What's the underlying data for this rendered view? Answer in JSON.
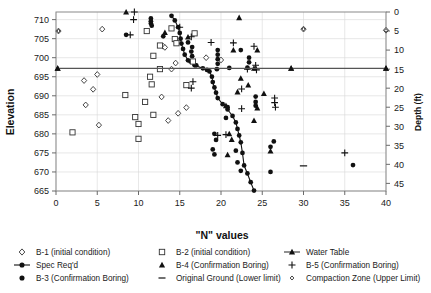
{
  "chart_data": {
    "type": "scatter",
    "title": "",
    "xlabel": "\"N\" values",
    "ylabel": "Elevation",
    "y2label": "Depth (ft)",
    "xlim": [
      0,
      40
    ],
    "ylim": [
      665,
      712
    ],
    "y2lim": [
      0,
      47
    ],
    "xticks": [
      0,
      5,
      10,
      15,
      20,
      25,
      30,
      35,
      40
    ],
    "yticks": [
      665,
      670,
      675,
      680,
      685,
      690,
      695,
      700,
      705,
      710
    ],
    "y2ticks": [
      0,
      5,
      10,
      15,
      20,
      25,
      30,
      35,
      40,
      45
    ],
    "grid": true,
    "legend_position": "bottom",
    "series": [
      {
        "name": "B-1 (initial condition)",
        "marker": "open-diamond",
        "points": [
          [
            0.3,
            707.0
          ],
          [
            5.6,
            707.5
          ],
          [
            5.0,
            695.6
          ],
          [
            3.4,
            694.0
          ],
          [
            4.5,
            691.7
          ],
          [
            3.6,
            687.6
          ],
          [
            5.2,
            682.3
          ],
          [
            13.0,
            703.0
          ],
          [
            13.2,
            702.7
          ],
          [
            14.5,
            698.6
          ],
          [
            14.0,
            697.0
          ],
          [
            12.8,
            689.7
          ],
          [
            15.8,
            686.9
          ],
          [
            14.8,
            685.4
          ],
          [
            13.6,
            683.5
          ],
          [
            18.2,
            700.0
          ],
          [
            20.0,
            699.4
          ],
          [
            30.0,
            707.5
          ],
          [
            40.0,
            707.2
          ]
        ]
      },
      {
        "name": "Spec Req'd",
        "marker": "filled-circle-line",
        "points": [
          [
            14.0,
            711.0
          ],
          [
            14.4,
            709.8
          ],
          [
            14.8,
            708.0
          ],
          [
            15.0,
            706.5
          ],
          [
            15.1,
            705.0
          ],
          [
            15.2,
            703.7
          ],
          [
            15.4,
            702.3
          ],
          [
            15.6,
            700.8
          ],
          [
            16.0,
            699.3
          ],
          [
            16.8,
            698.0
          ],
          [
            17.8,
            697.2
          ],
          [
            18.6,
            696.4
          ],
          [
            18.9,
            695.0
          ],
          [
            19.0,
            693.6
          ],
          [
            19.2,
            692.2
          ],
          [
            19.4,
            690.8
          ],
          [
            19.6,
            689.4
          ],
          [
            20.2,
            687.8
          ],
          [
            20.8,
            686.4
          ],
          [
            21.4,
            684.7
          ],
          [
            21.8,
            683.0
          ],
          [
            22.0,
            681.3
          ],
          [
            22.2,
            679.6
          ],
          [
            22.4,
            677.8
          ],
          [
            22.6,
            675.0
          ],
          [
            22.8,
            671.7
          ],
          [
            23.2,
            669.6
          ],
          [
            23.6,
            667.3
          ],
          [
            24.0,
            665.1
          ]
        ]
      },
      {
        "name": "B-3 (Confirmation Boring)",
        "marker": "filled-circle",
        "points": [
          [
            8.5,
            706.0
          ],
          [
            11.5,
            710.3
          ],
          [
            11.5,
            709.6
          ],
          [
            11.5,
            709.0
          ],
          [
            11.6,
            708.4
          ],
          [
            13.0,
            705.6
          ],
          [
            16.0,
            704.0
          ],
          [
            16.5,
            702.8
          ],
          [
            16.4,
            701.6
          ],
          [
            16.5,
            700.4
          ],
          [
            16.3,
            699.0
          ],
          [
            17.0,
            698.0
          ],
          [
            19.6,
            702.0
          ],
          [
            19.6,
            700.8
          ],
          [
            19.6,
            699.6
          ],
          [
            19.6,
            698.4
          ],
          [
            19.5,
            697.0
          ],
          [
            18.3,
            696.8
          ],
          [
            21.0,
            697.3
          ],
          [
            22.4,
            702.0
          ],
          [
            23.4,
            700.0
          ],
          [
            23.4,
            698.8
          ],
          [
            23.2,
            697.4
          ],
          [
            24.2,
            689.8
          ],
          [
            24.2,
            688.4
          ],
          [
            24.2,
            687.4
          ],
          [
            20.8,
            687.0
          ],
          [
            20.6,
            684.2
          ],
          [
            19.2,
            680.0
          ],
          [
            19.4,
            678.4
          ],
          [
            19.0,
            675.9
          ],
          [
            19.2,
            674.6
          ],
          [
            21.8,
            675.6
          ],
          [
            22.0,
            672.5
          ],
          [
            22.4,
            670.3
          ],
          [
            26.0,
            670.0
          ],
          [
            26.0,
            676.6
          ],
          [
            36.0,
            671.8
          ],
          [
            26.4,
            678.0
          ]
        ]
      },
      {
        "name": "B-2 (initial condition)",
        "marker": "open-square",
        "points": [
          [
            11.0,
            707.0
          ],
          [
            14.0,
            707.7
          ],
          [
            14.4,
            704.9
          ],
          [
            14.6,
            703.8
          ],
          [
            16.8,
            706.4
          ],
          [
            11.8,
            700.5
          ],
          [
            16.6,
            699.0
          ],
          [
            11.4,
            695.0
          ],
          [
            11.6,
            693.0
          ],
          [
            8.4,
            690.2
          ],
          [
            10.8,
            688.4
          ],
          [
            11.8,
            685.0
          ],
          [
            9.6,
            684.4
          ],
          [
            10.0,
            682.6
          ],
          [
            10.0,
            678.7
          ],
          [
            2.0,
            680.4
          ],
          [
            15.8,
            692.8
          ],
          [
            12.6,
            697.0
          ],
          [
            12.6,
            703.2
          ]
        ]
      },
      {
        "name": "B-4 (Confirmation Boring)",
        "marker": "filled-triangle",
        "points": [
          [
            8.5,
            712.0
          ],
          [
            13.2,
            706.6
          ],
          [
            16.0,
            705.4
          ],
          [
            21.5,
            702.0
          ],
          [
            24.4,
            702.0
          ],
          [
            22.2,
            710.5
          ],
          [
            24.0,
            697.2
          ],
          [
            22.4,
            694.6
          ],
          [
            23.3,
            692.8
          ],
          [
            22.0,
            691.0
          ],
          [
            25.2,
            690.6
          ],
          [
            24.4,
            686.8
          ],
          [
            20.6,
            687.4
          ],
          [
            21.0,
            680.0
          ],
          [
            21.3,
            678.5
          ],
          [
            20.8,
            674.5
          ],
          [
            26.0,
            675.5
          ],
          [
            28.5,
            697.2
          ],
          [
            40.0,
            697.2
          ],
          [
            0.2,
            697.2
          ],
          [
            24.0,
            683.5
          ]
        ]
      },
      {
        "name": "B-5 (Confirmation Boring)",
        "marker": "plus",
        "points": [
          [
            9.5,
            712.0
          ],
          [
            9.4,
            710.0
          ],
          [
            9.0,
            706.0
          ],
          [
            15.0,
            708.0
          ],
          [
            16.4,
            705.5
          ],
          [
            18.8,
            704.0
          ],
          [
            21.5,
            703.9
          ],
          [
            24.0,
            703.0
          ],
          [
            24.2,
            698.0
          ],
          [
            24.3,
            696.8
          ],
          [
            16.6,
            693.7
          ],
          [
            16.4,
            692.0
          ],
          [
            26.6,
            687.0
          ],
          [
            26.5,
            689.4
          ],
          [
            22.5,
            691.8
          ],
          [
            22.5,
            686.6
          ],
          [
            19.6,
            679.6
          ],
          [
            20.6,
            679.8
          ],
          [
            26.5,
            688.2
          ],
          [
            35.0,
            675.0
          ],
          [
            23.2,
            697.0
          ]
        ]
      },
      {
        "name": "Original Ground (Lower limit)",
        "marker": "dash",
        "points": [
          [
            30.0,
            671.6
          ]
        ]
      },
      {
        "name": "Water Table",
        "marker": "filled-triangle-line",
        "points": [
          [
            0.2,
            697.2
          ],
          [
            28.5,
            697.2
          ],
          [
            40.0,
            697.2
          ]
        ]
      },
      {
        "name": "Compaction Zone (Upper Limit)",
        "marker": "small-open-diamond",
        "points": [
          [
            30.0,
            707.5
          ],
          [
            40.0,
            707.2
          ],
          [
            0.3,
            707.0
          ]
        ]
      }
    ]
  },
  "legend": {
    "items": [
      {
        "label": "B-1 (initial condition)",
        "marker": "open-diamond"
      },
      {
        "label": "B-2 (initial condition)",
        "marker": "open-square"
      },
      {
        "label": "Water Table",
        "marker": "filled-triangle-line"
      },
      {
        "label": "Spec Req'd",
        "marker": "filled-circle-line"
      },
      {
        "label": "B-4 (Confirmation Boring)",
        "marker": "filled-triangle"
      },
      {
        "label": "B-5 (Confirmation Boring)",
        "marker": "plus"
      },
      {
        "label": "B-3 (Confirmation Boring)",
        "marker": "filled-circle"
      },
      {
        "label": "Original Ground (Lower limit)",
        "marker": "dash"
      },
      {
        "label": "Compaction Zone (Upper Limit)",
        "marker": "small-open-diamond"
      }
    ]
  }
}
